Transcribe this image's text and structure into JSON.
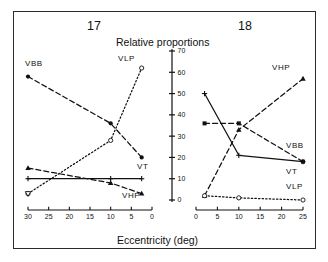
{
  "figure": {
    "title": "Relative proportions",
    "xlabel": "Eccentricity (deg)",
    "panel_left_number": "17",
    "panel_right_number": "18"
  },
  "yaxis": {
    "ticks": [
      "0",
      "10",
      "20",
      "30",
      "40",
      "50",
      "60",
      "70"
    ],
    "min": 0,
    "max": 70
  },
  "panel_left": {
    "number": "17",
    "xticks": [
      "30",
      "25",
      "20",
      "15",
      "10",
      "5",
      "0"
    ],
    "labels": {
      "vbb": "VBB",
      "vlp": "VLP",
      "vt": "VT",
      "vhp": "VHP"
    }
  },
  "panel_right": {
    "number": "18",
    "xticks": [
      "0",
      "5",
      "10",
      "15",
      "20",
      "25"
    ],
    "labels": {
      "vhp": "VHP",
      "vbb": "VBB",
      "vt": "VT",
      "vlp": "VLP"
    }
  },
  "colors": {
    "ink": "#111111",
    "frame": "#2b2b2b",
    "background": "#ffffff"
  },
  "chart_data": {
    "type": "line",
    "title": "Relative proportions",
    "xlabel": "Eccentricity (deg)",
    "ylabel": "",
    "ylim": [
      0,
      70
    ],
    "grid": false,
    "legend": "inline-labels",
    "panels": [
      {
        "name": "17",
        "xlim": [
          30,
          0
        ],
        "xticks": [
          30,
          25,
          20,
          15,
          10,
          5,
          0
        ],
        "yticks": [
          0,
          10,
          20,
          30,
          40,
          50,
          60,
          70
        ],
        "series": [
          {
            "name": "VBB",
            "marker": "filled-circle",
            "line": "dashed",
            "x": [
              30,
              10,
              2.5
            ],
            "values": [
              58,
              36,
              20
            ]
          },
          {
            "name": "VLP",
            "marker": "open-circle",
            "line": "dotted",
            "x": [
              30,
              10,
              2.5
            ],
            "values": [
              3,
              28,
              62
            ]
          },
          {
            "name": "VT",
            "marker": "plus",
            "line": "solid",
            "x": [
              30,
              10,
              2.5
            ],
            "values": [
              10,
              10,
              10
            ]
          },
          {
            "name": "VHP",
            "marker": "filled-triangle",
            "line": "dashed",
            "x": [
              30,
              10,
              2.5
            ],
            "values": [
              15,
              8,
              3
            ]
          }
        ]
      },
      {
        "name": "18",
        "xlim": [
          0,
          25
        ],
        "xticks": [
          0,
          5,
          10,
          15,
          20,
          25
        ],
        "yticks": [
          0,
          10,
          20,
          30,
          40,
          50,
          60,
          70
        ],
        "series": [
          {
            "name": "VT",
            "marker": "plus",
            "line": "solid",
            "x": [
              2,
              10,
              25
            ],
            "values": [
              50,
              21,
              18
            ]
          },
          {
            "name": "VBB",
            "marker": "filled-square",
            "line": "dashed",
            "x": [
              2,
              10,
              25
            ],
            "values": [
              36,
              36,
              18
            ]
          },
          {
            "name": "VHP",
            "marker": "filled-triangle",
            "line": "dashed",
            "x": [
              2,
              10,
              25
            ],
            "values": [
              2,
              33,
              57
            ]
          },
          {
            "name": "VLP",
            "marker": "open-circle",
            "line": "dotted",
            "x": [
              2,
              10,
              25
            ],
            "values": [
              2,
              1,
              0
            ]
          }
        ]
      }
    ]
  }
}
